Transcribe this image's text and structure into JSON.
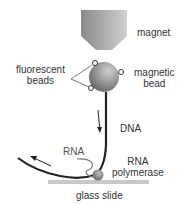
{
  "labels": {
    "magnet": "magnet",
    "fluorescent_line1": "fluorescent",
    "fluorescent_line2": "beads",
    "magnetic_line1": "magnetic",
    "magnetic_line2": "bead",
    "dna": "DNA",
    "rna": "RNA",
    "rna_pol_line1": "RNA",
    "rna_pol_line2": "polymerase",
    "glass_slide": "glass slide"
  },
  "colors": {
    "magnet_light": "#c8c8c8",
    "magnet_dark": "#8a8a8a",
    "bead_light": "#c0c0c0",
    "bead_dark": "#707070",
    "strand": "#222222",
    "slide": "#c8c8c8",
    "text": "#333333"
  }
}
